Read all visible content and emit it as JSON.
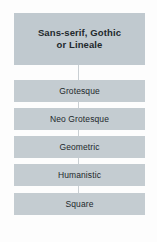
{
  "diagram": {
    "type": "hierarchy-flowchart",
    "orientation": "vertical",
    "background_color": "#fdfdfd",
    "connector_color": "#c9cfd3",
    "root": {
      "label": "Sans-serif, Gothic\nor Lineale",
      "box_color": "#c0c9cf",
      "text_color": "#22282c",
      "bold": true
    },
    "children": [
      {
        "label": "Grotesque",
        "box_color": "#c4ccd1",
        "text_color": "#22282c"
      },
      {
        "label": "Neo Grotesque",
        "box_color": "#c4ccd1",
        "text_color": "#22282c"
      },
      {
        "label": "Geometric",
        "box_color": "#c4ccd1",
        "text_color": "#22282c"
      },
      {
        "label": "Humanistic",
        "box_color": "#c4ccd1",
        "text_color": "#22282c"
      },
      {
        "label": "Square",
        "box_color": "#c4ccd1",
        "text_color": "#22282c"
      }
    ]
  }
}
